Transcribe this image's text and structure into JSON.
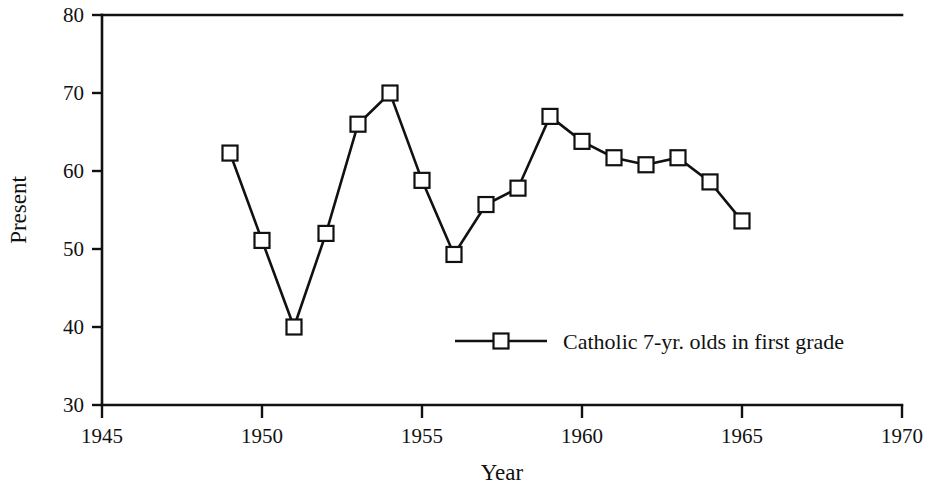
{
  "chart_data": {
    "type": "line",
    "title": "",
    "xlabel": "Year",
    "ylabel": "Present",
    "xlim": [
      1945,
      1970
    ],
    "ylim": [
      30,
      80
    ],
    "xticks": [
      1945,
      1950,
      1955,
      1960,
      1965,
      1970
    ],
    "yticks": [
      30,
      40,
      50,
      60,
      70,
      80
    ],
    "xtick_labels": [
      "1945",
      "1950",
      "1955",
      "1960",
      "1965",
      "1970"
    ],
    "ytick_labels": [
      "30",
      "40",
      "50",
      "60",
      "70",
      "80"
    ],
    "grid": false,
    "legend_position": "inside-lower-right",
    "series": [
      {
        "name": "Catholic 7-yr. olds in first grade",
        "marker": "square",
        "color": "#111111",
        "x": [
          1949,
          1950,
          1951,
          1952,
          1953,
          1954,
          1955,
          1956,
          1957,
          1958,
          1959,
          1960,
          1961,
          1962,
          1963,
          1964,
          1965
        ],
        "y": [
          62.3,
          51.1,
          40.0,
          52.0,
          66.0,
          70.0,
          58.8,
          49.3,
          55.7,
          57.8,
          67.0,
          63.8,
          61.7,
          60.8,
          61.7,
          58.6,
          53.6
        ]
      }
    ]
  },
  "legend": {
    "entries": [
      {
        "label": "Catholic 7-yr. olds in first grade"
      }
    ]
  },
  "axes": {
    "x_title": "Year",
    "y_title": "Present"
  }
}
